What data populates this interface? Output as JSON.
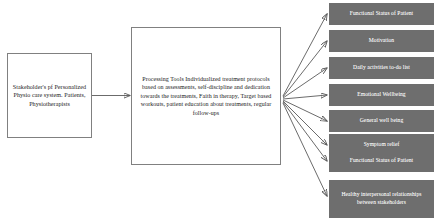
{
  "diagram": {
    "colors": {
      "outcome_fill": "#6e6e6e",
      "outcome_text": "#ffffff",
      "box_border": "#808080",
      "arrow": "#5a5a5a",
      "background": "#ffffff"
    },
    "input_node": {
      "id": "stakeholders",
      "label": "Stakeholder's pf Personalized Physio care system. Patients, Physiotherapists"
    },
    "process_node": {
      "id": "processing-tools",
      "heading": "Processing Tools",
      "label": "Processing Tools Individualized treatment protocols based on assessments, self-discipline and dedication towards the treatments, Faith in therapy, Target based workouts, patient education about treatments, regular follow-ups"
    },
    "outcome_nodes": [
      {
        "id": "functional-status-of-patient-1",
        "label": "Functional Status of Patient"
      },
      {
        "id": "motivation",
        "label": "Motivation"
      },
      {
        "id": "daily-activities-to-do-list",
        "label": "Daily activities to-do list"
      },
      {
        "id": "emotional-wellbeing",
        "label": "Emotional Wellbeing"
      },
      {
        "id": "general-well-being",
        "label": "General well being"
      },
      {
        "id": "symptom-relief",
        "label": "Symptom relief"
      },
      {
        "id": "functional-status-of-patient-2",
        "label": "Functional Status of Patient"
      },
      {
        "id": "healthy-interpersonal-relationships",
        "label": "Healthy interpersonal relationships between stakeholders"
      }
    ]
  }
}
